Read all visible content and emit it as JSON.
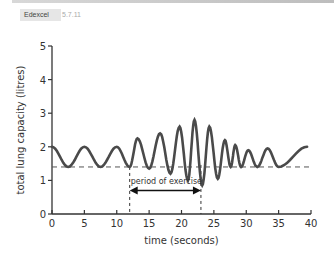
{
  "header": {
    "badge": "Edexcel",
    "code": "5.7.11"
  },
  "chart_data": {
    "type": "line",
    "title": "",
    "xlabel": "time (seconds)",
    "ylabel": "total lung capacity (litres)",
    "xlim": [
      0,
      40
    ],
    "ylim": [
      0,
      5
    ],
    "xticks": [
      0,
      5,
      10,
      15,
      20,
      25,
      30,
      35,
      40
    ],
    "yticks": [
      0,
      1,
      2,
      3,
      4,
      5
    ],
    "grid": false,
    "baseline": {
      "value": 1.4,
      "style": "dashed",
      "label": ""
    },
    "annotations": [
      {
        "text": "period of exercise",
        "x_start": 12,
        "x_end": 23,
        "y": 0.7,
        "style": "double-arrow with dashed vertical markers"
      }
    ],
    "series": [
      {
        "name": "total lung capacity",
        "x": [
          0,
          2.5,
          5,
          7.5,
          10,
          12,
          13.2,
          15,
          16.7,
          18.3,
          19.7,
          21,
          22,
          23.2,
          24.3,
          25.6,
          26.7,
          27.6,
          28.3,
          29.2,
          30.3,
          31.7,
          33.3,
          35,
          39.4
        ],
        "values": [
          2.0,
          1.4,
          2.0,
          1.4,
          2.0,
          1.4,
          2.25,
          1.35,
          2.4,
          1.2,
          2.6,
          1.0,
          2.8,
          0.85,
          2.6,
          1.05,
          2.2,
          1.4,
          2.05,
          1.4,
          1.9,
          1.4,
          1.95,
          1.4,
          2.0
        ]
      }
    ]
  },
  "labels": {
    "xticks": [
      "0",
      "5",
      "10",
      "15",
      "20",
      "25",
      "30",
      "35",
      "40"
    ],
    "yticks": [
      "0",
      "1",
      "2",
      "3",
      "4",
      "5"
    ],
    "xlabel": "time (seconds)",
    "ylabel": "total lung capacity (litres)",
    "annotation": "period of exercise"
  },
  "colors": {
    "line": "#4a4a4a",
    "axis": "#333333",
    "badge_bg": "#e6e6e6"
  }
}
